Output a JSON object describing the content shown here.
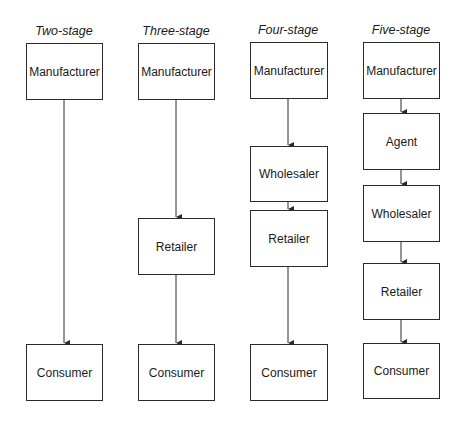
{
  "diagram": {
    "columns": [
      {
        "title": "Two-stage",
        "nodes": [
          "Manufacturer",
          "Consumer"
        ]
      },
      {
        "title": "Three-stage",
        "nodes": [
          "Manufacturer",
          "Retailer",
          "Consumer"
        ]
      },
      {
        "title": "Four-stage",
        "nodes": [
          "Manufacturer",
          "Wholesaler",
          "Retailer",
          "Consumer"
        ]
      },
      {
        "title": "Five-stage",
        "nodes": [
          "Manufacturer",
          "Agent",
          "Wholesaler",
          "Retailer",
          "Consumer"
        ]
      }
    ],
    "colors": {
      "line": "#2a2a2a",
      "background": "#ffffff",
      "text": "#1a1a1a"
    }
  }
}
